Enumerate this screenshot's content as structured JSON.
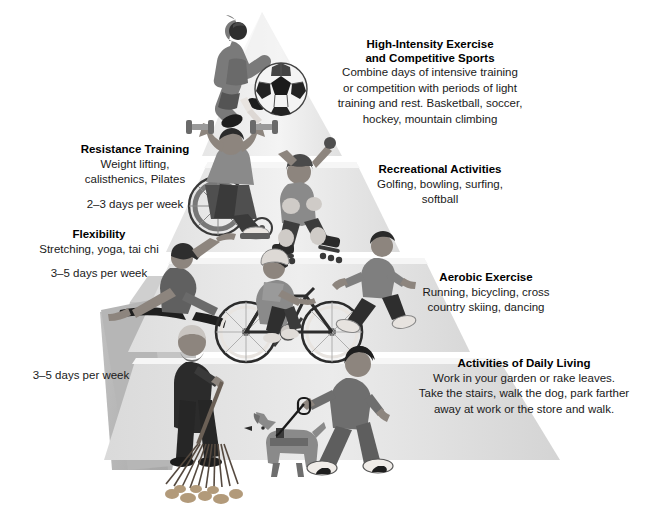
{
  "diagram": {
    "title_semantic": "physical-activity-pyramid",
    "type": "pyramid",
    "tiers": [
      {
        "id": "high-intensity",
        "level": 1,
        "side": "right",
        "heading": "High-Intensity Exercise\nand Competitive Sports",
        "heading_line1": "High-Intensity Exercise",
        "heading_line2": "and Competitive Sports",
        "body": "Combine days of intensive training or competition with periods of light training and rest. Basketball, soccer, hockey, mountain climbing",
        "body_lines": [
          "Combine days of intensive training",
          "or competition with periods of light",
          "training and rest. Basketball, soccer,",
          "hockey, mountain climbing"
        ],
        "frequency": "",
        "align": "center",
        "illustrations": [
          "soccer-player-kicking",
          "soccer-ball"
        ]
      },
      {
        "id": "resistance-training",
        "level": 2,
        "side": "left",
        "heading_line1": "Resistance Training",
        "heading_line2": "",
        "body_lines": [
          "Weight lifting,",
          "calisthenics, Pilates"
        ],
        "frequency": "2–3 days per week",
        "align": "center",
        "illustrations": [
          "wheelchair-athlete-dumbbells"
        ]
      },
      {
        "id": "recreational-activities",
        "level": 2,
        "side": "right",
        "heading_line1": "Recreational Activities",
        "heading_line2": "",
        "body_lines": [
          "Golfing, bowling, surfing,",
          "softball"
        ],
        "frequency": "",
        "align": "center",
        "illustrations": [
          "inline-skater"
        ]
      },
      {
        "id": "flexibility",
        "level": 3,
        "side": "left",
        "heading_line1": "Flexibility",
        "heading_line2": "",
        "body_lines": [
          "Stretching, yoga, tai chi"
        ],
        "frequency": "3–5 days per week",
        "align": "center",
        "illustrations": [
          "woman-stretching-yoga"
        ]
      },
      {
        "id": "aerobic-exercise",
        "level": 3,
        "side": "right",
        "heading_line1": "Aerobic Exercise",
        "heading_line2": "",
        "body_lines": [
          "Running, bicycling, cross",
          "country skiing, dancing"
        ],
        "frequency": "",
        "align": "center",
        "illustrations": [
          "cyclist-on-bicycle",
          "running-man"
        ]
      },
      {
        "id": "activities-of-daily-living",
        "level": 4,
        "side": "right",
        "heading_line1": "Activities of Daily Living",
        "heading_line2": "",
        "body_lines": [
          "Work in your garden or rake leaves.",
          "Take the stairs, walk the dog, park farther",
          "away at work or the store and walk."
        ],
        "frequency": "",
        "align": "center",
        "illustrations": [
          "man-raking-leaves",
          "person-walking-dog",
          "dog"
        ]
      }
    ],
    "base_frequency": "3–5 days per week",
    "colors": {
      "tier_face_lightest": "#f2f2f2",
      "tier_face_light": "#ebebeb",
      "tier_face_mid": "#e2e2e2",
      "tier_face_dark": "#d8d8d8",
      "tier_shadow_side": "#b8b8b8",
      "tier_shadow_side_dark": "#a9a9a9",
      "text": "#111111",
      "background": "#ffffff"
    }
  }
}
